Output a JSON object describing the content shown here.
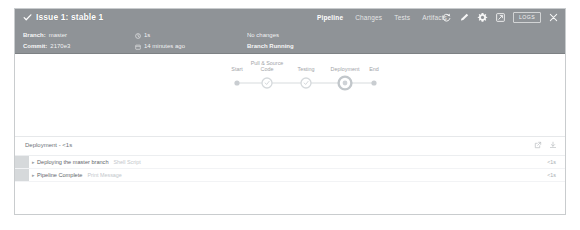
{
  "window": {
    "background": "#ffffff",
    "border_color": "#c9ccce"
  },
  "run_header": {
    "background": "#8f9397",
    "status_icon": "check-icon",
    "title": "Issue 1: stable 1",
    "tabs": [
      {
        "label": "Pipeline",
        "active": true
      },
      {
        "label": "Changes",
        "active": false
      },
      {
        "label": "Tests",
        "active": false
      },
      {
        "label": "Artifacts",
        "active": false
      }
    ],
    "actions": [
      {
        "name": "replay-icon",
        "label": "Replay"
      },
      {
        "name": "edit-icon",
        "label": "Edit"
      },
      {
        "name": "gear-icon",
        "label": "Settings"
      },
      {
        "name": "open-logs-icon",
        "label": "Open Logs"
      }
    ],
    "logs_pill_label": "LOGS",
    "close_label": "close-icon",
    "meta": {
      "branch_label": "Branch:",
      "branch_value": "master",
      "commit_label": "Commit:",
      "commit_value": "2170e3",
      "duration_icon": "clock-icon",
      "duration_value": "1s",
      "time_icon": "calendar-icon",
      "time_value": "14 minutes ago",
      "changes_text": "No changes",
      "status_text": "Branch Running"
    }
  },
  "pipeline": {
    "stages": [
      {
        "name": "Start",
        "label_line1": "Start",
        "label_line2": "",
        "type": "terminal",
        "x": 222
      },
      {
        "name": "Pull & Source Code",
        "label_line1": "Pull & Source",
        "label_line2": "Code",
        "type": "stage",
        "x": 252
      },
      {
        "name": "Testing",
        "label_line1": "Testing",
        "label_line2": "",
        "type": "stage",
        "x": 291
      },
      {
        "name": "Deployment",
        "label_line1": "Deployment",
        "label_line2": "",
        "type": "stage-active",
        "x": 330
      },
      {
        "name": "End",
        "label_line1": "End",
        "label_line2": "",
        "type": "terminal",
        "x": 359
      }
    ],
    "node_color": "#d2d6d9",
    "line_color": "#d8dbde",
    "active_node_color": "#c2c7cb"
  },
  "results": {
    "title": "Deployment - <1s",
    "header_actions": [
      {
        "name": "external-link-icon",
        "label": "Open in new tab"
      },
      {
        "name": "download-icon",
        "label": "Download logs"
      }
    ],
    "steps": [
      {
        "caret": "▸",
        "text": "Deploying the master branch",
        "subtext": "Shell Script",
        "duration": "<1s"
      },
      {
        "caret": "▸",
        "text": "Pipeline Complete",
        "subtext": "Print Message",
        "duration": "<1s"
      }
    ]
  }
}
